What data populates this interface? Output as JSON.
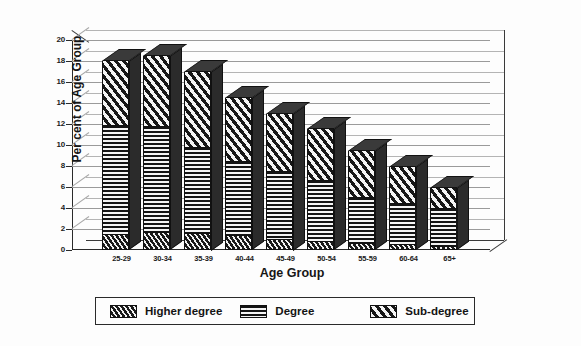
{
  "chart_data": {
    "type": "bar",
    "subtype": "stacked-3d-column",
    "title": "",
    "xlabel": "Age Group",
    "ylabel": "Per cent of Age Group",
    "categories": [
      "25-29",
      "30-34",
      "35-39",
      "40-44",
      "45-49",
      "50-54",
      "55-59",
      "60-64",
      "65+"
    ],
    "series": [
      {
        "name": "Higher degree",
        "pattern": "dense-diagonal-hatch",
        "values": [
          1.4,
          1.6,
          1.5,
          1.3,
          1.0,
          0.8,
          0.6,
          0.5,
          0.3
        ]
      },
      {
        "name": "Degree",
        "pattern": "horizontal-lines",
        "values": [
          10.4,
          10.1,
          8.2,
          7.1,
          6.4,
          5.8,
          4.4,
          3.9,
          3.6
        ]
      },
      {
        "name": "Sub-degree",
        "pattern": "wide-diagonal-hatch",
        "values": [
          6.2,
          6.8,
          7.3,
          6.1,
          5.6,
          4.9,
          4.4,
          3.5,
          2.0
        ]
      }
    ],
    "totals": [
      18.0,
      18.5,
      17.0,
      14.5,
      13.0,
      11.5,
      9.4,
      7.9,
      5.9
    ],
    "ylim": [
      0,
      20
    ],
    "ytick_step": 2,
    "ytick_labels": [
      "20",
      "18",
      "16",
      "14",
      "12",
      "10",
      "8",
      "6",
      "4",
      "2",
      "0"
    ],
    "grid": true,
    "grid_axis": "y",
    "legend_position": "bottom",
    "colors": {
      "ink": "#1a1a1a",
      "grid": "#9a9a9a",
      "fill_light": "#f2f2f2",
      "fill_dark": "#1a1a1a",
      "background": "#fdfdfd"
    }
  },
  "axes": {
    "y_title": "Per cent of Age Group",
    "x_title": "Age Group"
  },
  "legend": {
    "items": [
      {
        "label": "Higher degree",
        "swatch": "dense-diagonal-hatch-swatch"
      },
      {
        "label": "Degree",
        "swatch": "horizontal-lines-swatch"
      },
      {
        "label": "Sub-degree",
        "swatch": "wide-diagonal-hatch-swatch"
      }
    ]
  }
}
